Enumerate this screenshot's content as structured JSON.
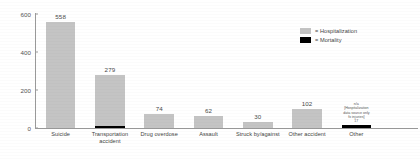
{
  "chart_data": {
    "type": "bar",
    "title": "",
    "xlabel": "",
    "ylabel": "",
    "ylim": [
      0,
      600
    ],
    "yticks": [
      "0",
      "200",
      "400",
      "600"
    ],
    "grid": false,
    "legend_position": "top-right",
    "categories": [
      "Suicide",
      "Transportation\naccident",
      "Drug overdose",
      "Assault",
      "Struck by/against",
      "Other accident",
      "Other"
    ],
    "series": [
      {
        "name": "Hospitalization",
        "color": "#c4c4c4",
        "values": [
          558,
          279,
          74,
          62,
          30,
          102,
          null
        ],
        "labels": [
          "558",
          "279",
          "74",
          "62",
          "30",
          "102",
          "n/a"
        ]
      },
      {
        "name": "Mortality",
        "color": "#000000",
        "values": [
          0,
          12,
          0,
          0,
          0,
          0,
          17
        ],
        "labels": [
          "",
          "",
          "",
          "",
          "",
          "",
          "17"
        ]
      }
    ],
    "annotations": [
      {
        "category": "Other",
        "text": "n/a\n[Hospitalization\ndata source only\nfx injuries]\n17"
      }
    ]
  },
  "axis": {
    "y_ticks": [
      {
        "label": "600",
        "value": 600
      },
      {
        "label": "400",
        "value": 400
      },
      {
        "label": "200",
        "value": 200
      },
      {
        "label": "0",
        "value": 0
      }
    ]
  },
  "bars": [
    {
      "category": "Suicide",
      "label": "Suicide",
      "value_label": "558",
      "hosp": 558,
      "mort": 0,
      "note": ""
    },
    {
      "category": "Transportation accident",
      "label": "Transportation\naccident",
      "value_label": "279",
      "hosp": 279,
      "mort": 12,
      "note": ""
    },
    {
      "category": "Drug overdose",
      "label": "Drug overdose",
      "value_label": "74",
      "hosp": 74,
      "mort": 0,
      "note": ""
    },
    {
      "category": "Assault",
      "label": "Assault",
      "value_label": "62",
      "hosp": 62,
      "mort": 0,
      "note": ""
    },
    {
      "category": "Struck by/against",
      "label": "Struck by/against",
      "value_label": "30",
      "hosp": 30,
      "mort": 0,
      "note": ""
    },
    {
      "category": "Other accident",
      "label": "Other accident",
      "value_label": "102",
      "hosp": 102,
      "mort": 0,
      "note": ""
    },
    {
      "category": "Other",
      "label": "Other",
      "value_label": "",
      "hosp": 0,
      "mort": 17,
      "note": "n/a\n[Hospitalization\ndata source only\nfx injuries]\n17"
    }
  ],
  "legend": {
    "items": [
      {
        "label": "= Hospitalization",
        "color": "#c4c4c4"
      },
      {
        "label": "= Mortality",
        "color": "#000000"
      }
    ]
  }
}
